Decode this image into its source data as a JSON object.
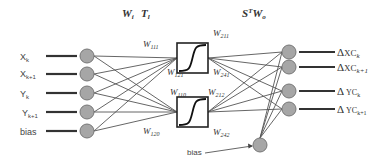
{
  "diagram": {
    "header": {
      "left_label_w": "W",
      "left_label_w_sub": "i",
      "left_label_t": "T",
      "left_label_t_sub": "l",
      "right_label_s": "S",
      "right_label_sup": "T",
      "right_label_w": "W",
      "right_label_w_sub": "o"
    },
    "inputs": [
      {
        "base": "X",
        "sub": "k"
      },
      {
        "base": "X",
        "sub": "k+1"
      },
      {
        "base": "Y",
        "sub": "k"
      },
      {
        "base": "Y",
        "sub": "k+1"
      },
      {
        "base": "bias",
        "sub": ""
      }
    ],
    "hidden_units": [
      {
        "name": "sigmoid-unit-1",
        "activation": "sigmoid"
      },
      {
        "name": "sigmoid-unit-2",
        "activation": "sigmoid"
      }
    ],
    "weights": [
      {
        "base": "W",
        "sub": "111"
      },
      {
        "base": "W",
        "sub": "121"
      },
      {
        "base": "W",
        "sub": "110"
      },
      {
        "base": "W",
        "sub": "120"
      },
      {
        "base": "W",
        "sub": "211"
      },
      {
        "base": "W",
        "sub": "241"
      },
      {
        "base": "W",
        "sub": "212"
      },
      {
        "base": "W",
        "sub": "242"
      }
    ],
    "outputs": [
      {
        "delta": "Δ",
        "base": "XC",
        "sub": "k"
      },
      {
        "delta": "Δ",
        "base": "XC",
        "sub": "k+1"
      },
      {
        "delta": "Δ",
        "base": "YC",
        "sub": "k"
      },
      {
        "delta": "Δ",
        "base": "YC",
        "sub": "k+1"
      }
    ],
    "output_bias_label": "bias"
  }
}
